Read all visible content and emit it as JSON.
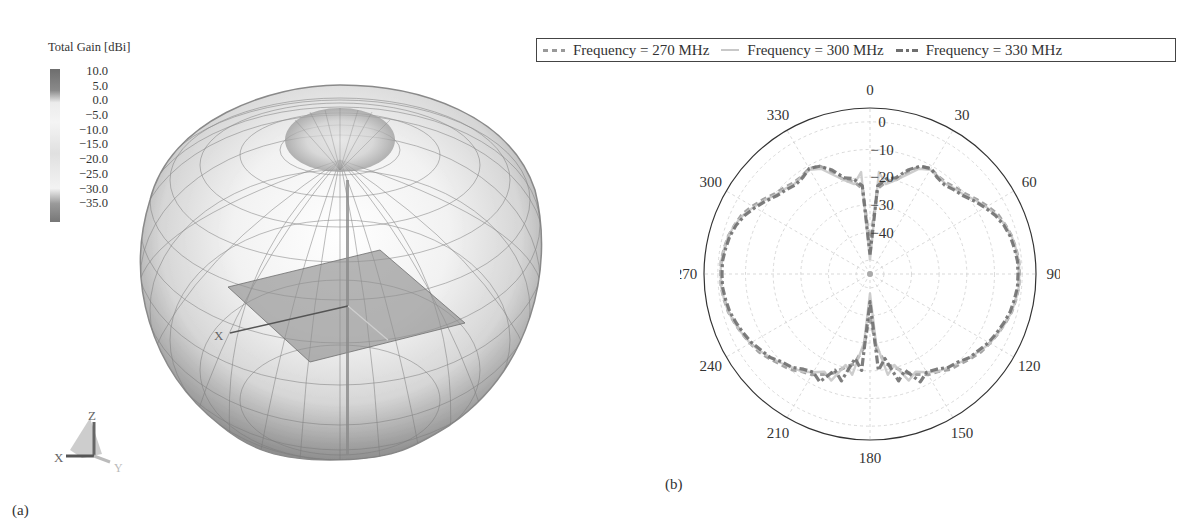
{
  "panel_a": {
    "label": "(a)",
    "colorbar": {
      "title": "Total Gain [dBi]",
      "ticks": [
        "10.0",
        "5.0",
        "0.0",
        "−5.0",
        "−10.0",
        "−15.0",
        "−20.0",
        "−25.0",
        "−30.0",
        "−35.0"
      ]
    },
    "axis_labels": {
      "x": "X",
      "y": "Y",
      "z": "Z",
      "model_x": "X"
    }
  },
  "panel_b": {
    "label": "(b)",
    "legend": [
      {
        "label": "Frequency = 270 MHz",
        "style": "dashed",
        "color": "#999999"
      },
      {
        "label": "Frequency = 300 MHz",
        "style": "solid",
        "color": "#c8c8c8"
      },
      {
        "label": "Frequency = 330 MHz",
        "style": "dash-dot",
        "color": "#6f6f6f"
      }
    ],
    "angle_labels": [
      "0",
      "30",
      "60",
      "90",
      "120",
      "150",
      "180",
      "210",
      "240",
      "270",
      "300",
      "330"
    ],
    "radial_labels": [
      "0",
      "−10",
      "−20",
      "−30",
      "−40"
    ]
  },
  "chart_data": [
    {
      "type": "heatmap",
      "title": "3D radiation pattern (Total Gain)",
      "colorbar_label": "Total Gain [dBi]",
      "colorbar_range": [
        -35.0,
        10.0
      ],
      "colorbar_ticks": [
        10.0,
        5.0,
        0.0,
        -5.0,
        -10.0,
        -15.0,
        -20.0,
        -25.0,
        -30.0,
        -35.0
      ],
      "axes": [
        "X",
        "Y",
        "Z"
      ],
      "panel": "(a)"
    },
    {
      "type": "line",
      "subtype": "polar",
      "panel": "(b)",
      "title": "",
      "angle_unit": "deg",
      "angle_zero": "top",
      "angle_direction": "clockwise",
      "angle_ticks": [
        0,
        30,
        60,
        90,
        120,
        150,
        180,
        210,
        240,
        270,
        300,
        330
      ],
      "radial_ticks": [
        0,
        -10,
        -20,
        -30,
        -40
      ],
      "radial_range": [
        -55,
        5
      ],
      "grid": true,
      "legend_position": "top",
      "x": [
        0,
        5,
        10,
        15,
        20,
        25,
        30,
        35,
        40,
        45,
        50,
        55,
        60,
        65,
        70,
        75,
        80,
        85,
        90,
        95,
        100,
        105,
        110,
        115,
        120,
        125,
        130,
        135,
        140,
        145,
        150,
        155,
        160,
        165,
        170,
        175,
        180,
        185,
        190,
        195,
        200,
        205,
        210,
        215,
        220,
        225,
        230,
        235,
        240,
        245,
        250,
        255,
        260,
        265,
        270,
        275,
        280,
        285,
        290,
        295,
        300,
        305,
        310,
        315,
        320,
        325,
        330,
        335,
        340,
        345,
        350,
        355
      ],
      "series": [
        {
          "name": "Frequency = 270 MHz",
          "values": [
            -45,
            -24,
            -21,
            -20,
            -16,
            -12,
            -11,
            -12,
            -12,
            -11,
            -10,
            -8,
            -6,
            -4,
            -3,
            -2,
            -1.5,
            -1,
            -1,
            -1,
            -1.5,
            -2,
            -3,
            -4,
            -5,
            -6,
            -7.5,
            -9,
            -10,
            -12,
            -13,
            -15,
            -17,
            -20,
            -22,
            -28,
            -40,
            -28,
            -22,
            -20,
            -17,
            -15,
            -13,
            -12,
            -10,
            -9,
            -7.5,
            -6,
            -5,
            -4,
            -3,
            -2,
            -1.5,
            -1,
            -1,
            -1,
            -1.5,
            -2,
            -3,
            -4,
            -6,
            -8,
            -10,
            -11,
            -12,
            -12,
            -11,
            -12,
            -16,
            -20,
            -21,
            -24
          ]
        },
        {
          "name": "Frequency = 300 MHz",
          "values": [
            -50,
            -18,
            -22,
            -20,
            -17,
            -13,
            -11.5,
            -12,
            -12.5,
            -11.5,
            -10.5,
            -8.5,
            -6.5,
            -4.5,
            -3,
            -2,
            -1.5,
            -1,
            -1,
            -1,
            -1.5,
            -2,
            -3,
            -4,
            -5,
            -6.5,
            -8,
            -9.5,
            -11,
            -12,
            -14,
            -16,
            -14,
            -21,
            -18,
            -30,
            -48,
            -30,
            -18,
            -21,
            -14,
            -16,
            -14,
            -12,
            -11,
            -9.5,
            -8,
            -6.5,
            -5,
            -4,
            -3,
            -2,
            -1.5,
            -1,
            -1,
            -1,
            -1.5,
            -2,
            -3,
            -4.5,
            -6.5,
            -8.5,
            -10.5,
            -11.5,
            -12.5,
            -12,
            -11.5,
            -13,
            -17,
            -20,
            -22,
            -18
          ]
        },
        {
          "name": "Frequency = 330 MHz",
          "values": [
            -48,
            -23,
            -20,
            -19,
            -15,
            -12,
            -11,
            -12.5,
            -13,
            -12,
            -11,
            -9,
            -7,
            -5,
            -3.5,
            -2.5,
            -2,
            -1.5,
            -1.5,
            -1.5,
            -2,
            -2.5,
            -3.5,
            -4.5,
            -5.5,
            -7,
            -8,
            -10,
            -11,
            -13,
            -14,
            -12,
            -18,
            -15,
            -24,
            -20,
            -45,
            -20,
            -24,
            -15,
            -18,
            -12,
            -14,
            -13,
            -11,
            -10,
            -8,
            -7,
            -5.5,
            -4.5,
            -3.5,
            -2.5,
            -2,
            -1.5,
            -1.5,
            -1.5,
            -2,
            -2.5,
            -3.5,
            -5,
            -7,
            -9,
            -11,
            -12,
            -13,
            -12.5,
            -11,
            -12,
            -15,
            -19,
            -20,
            -23
          ]
        }
      ]
    }
  ]
}
